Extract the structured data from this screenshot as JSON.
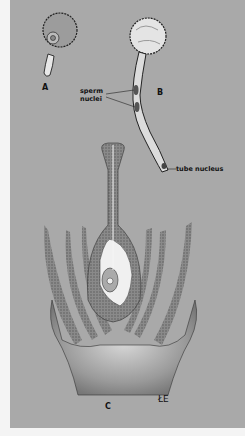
{
  "figure": {
    "panels": [
      {
        "id": "A",
        "label": "A",
        "subject": "pollen grain germinating"
      },
      {
        "id": "B",
        "label": "B",
        "subject": "pollen tube"
      },
      {
        "id": "C",
        "label": "C",
        "subject": "flower longitudinal section with pollen tube reaching ovule"
      }
    ],
    "annotations": {
      "sperm_nuclei_line1": "sperm",
      "sperm_nuclei_line2": "nuclei",
      "tube_nucleus": "tube nucleus"
    },
    "signature": "ŁE",
    "colors": {
      "background": "#a9a9a9",
      "margin": "#f4f4f4",
      "ink": "#222222",
      "highlight": "#eeeeee"
    }
  }
}
